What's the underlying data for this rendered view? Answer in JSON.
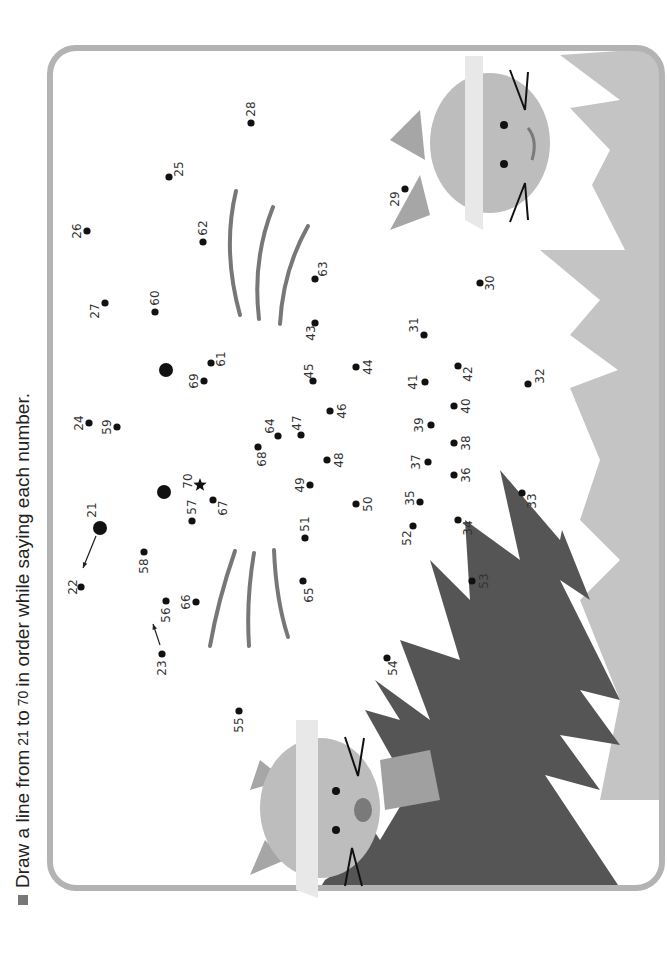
{
  "instruction": {
    "prefix": "Draw a line from",
    "start": "21",
    "middle": "to",
    "end": "70",
    "suffix": "in order while saying each number."
  },
  "colors": {
    "frame": "#b3b3b3",
    "dark_grass": "#555555",
    "light_grass": "#c4c4c4",
    "cat_face": "#bdbdbd",
    "cat_ear": "#a6a6a6",
    "cat_mask": "#e8e8e8",
    "cat_nose": "#7a7a7a",
    "whisker_guides": "#777777",
    "dots": "#111111"
  },
  "puzzle": {
    "start_number": 21,
    "end_number": 70,
    "end_marker": "star-icon",
    "dots": [
      {
        "n": "21",
        "x": 100,
        "y": 528,
        "lx": -8,
        "ly": -18,
        "big": true
      },
      {
        "n": "22",
        "x": 81,
        "y": 587,
        "lx": -8,
        "ly": 0
      },
      {
        "n": "23",
        "x": 162,
        "y": 654,
        "lx": 0,
        "ly": 14
      },
      {
        "n": "24",
        "x": 89,
        "y": 423,
        "lx": -10,
        "ly": 0
      },
      {
        "n": "25",
        "x": 169,
        "y": 177,
        "lx": 10,
        "ly": -8
      },
      {
        "n": "26",
        "x": 87,
        "y": 231,
        "lx": -10,
        "ly": 0
      },
      {
        "n": "27",
        "x": 105,
        "y": 303,
        "lx": -10,
        "ly": 8
      },
      {
        "n": "28",
        "x": 251,
        "y": 123,
        "lx": 0,
        "ly": -14
      },
      {
        "n": "29",
        "x": 405,
        "y": 189,
        "lx": -10,
        "ly": 10
      },
      {
        "n": "30",
        "x": 480,
        "y": 283,
        "lx": 10,
        "ly": 0
      },
      {
        "n": "31",
        "x": 424,
        "y": 335,
        "lx": -10,
        "ly": -10
      },
      {
        "n": "32",
        "x": 528,
        "y": 384,
        "lx": 12,
        "ly": -8
      },
      {
        "n": "33",
        "x": 522,
        "y": 493,
        "lx": 10,
        "ly": 8
      },
      {
        "n": "34",
        "x": 458,
        "y": 520,
        "lx": 10,
        "ly": 8
      },
      {
        "n": "35",
        "x": 420,
        "y": 502,
        "lx": -10,
        "ly": -4
      },
      {
        "n": "36",
        "x": 454,
        "y": 475,
        "lx": 12,
        "ly": 0
      },
      {
        "n": "37",
        "x": 428,
        "y": 462,
        "lx": -12,
        "ly": 0
      },
      {
        "n": "38",
        "x": 454,
        "y": 443,
        "lx": 12,
        "ly": 0
      },
      {
        "n": "39",
        "x": 431,
        "y": 425,
        "lx": -12,
        "ly": 0
      },
      {
        "n": "40",
        "x": 454,
        "y": 406,
        "lx": 12,
        "ly": 0
      },
      {
        "n": "41",
        "x": 425,
        "y": 382,
        "lx": -12,
        "ly": 0
      },
      {
        "n": "42",
        "x": 458,
        "y": 366,
        "lx": 10,
        "ly": 8
      },
      {
        "n": "43",
        "x": 315,
        "y": 323,
        "lx": -4,
        "ly": 10
      },
      {
        "n": "44",
        "x": 356,
        "y": 367,
        "lx": 12,
        "ly": 0
      },
      {
        "n": "45",
        "x": 313,
        "y": 381,
        "lx": -4,
        "ly": -10
      },
      {
        "n": "46",
        "x": 330,
        "y": 411,
        "lx": 12,
        "ly": 0
      },
      {
        "n": "47",
        "x": 301,
        "y": 435,
        "lx": -4,
        "ly": -12
      },
      {
        "n": "48",
        "x": 327,
        "y": 460,
        "lx": 12,
        "ly": 0
      },
      {
        "n": "49",
        "x": 310,
        "y": 485,
        "lx": -10,
        "ly": 0
      },
      {
        "n": "50",
        "x": 356,
        "y": 504,
        "lx": 12,
        "ly": 0
      },
      {
        "n": "51",
        "x": 305,
        "y": 538,
        "lx": 0,
        "ly": -14
      },
      {
        "n": "52",
        "x": 413,
        "y": 526,
        "lx": -6,
        "ly": 12
      },
      {
        "n": "53",
        "x": 472,
        "y": 581,
        "lx": 12,
        "ly": 0
      },
      {
        "n": "54",
        "x": 387,
        "y": 658,
        "lx": 6,
        "ly": 10
      },
      {
        "n": "55",
        "x": 239,
        "y": 711,
        "lx": 0,
        "ly": 14
      },
      {
        "n": "56",
        "x": 166,
        "y": 601,
        "lx": 0,
        "ly": 14
      },
      {
        "n": "57",
        "x": 192,
        "y": 521,
        "lx": 0,
        "ly": -14
      },
      {
        "n": "58",
        "x": 144,
        "y": 552,
        "lx": 0,
        "ly": 14
      },
      {
        "n": "59",
        "x": 117,
        "y": 427,
        "lx": -10,
        "ly": 0
      },
      {
        "n": "60",
        "x": 155,
        "y": 312,
        "lx": 0,
        "ly": -14
      },
      {
        "n": "61",
        "x": 211,
        "y": 363,
        "lx": 10,
        "ly": -4
      },
      {
        "n": "62",
        "x": 203,
        "y": 242,
        "lx": 0,
        "ly": -14
      },
      {
        "n": "63",
        "x": 315,
        "y": 279,
        "lx": 8,
        "ly": -10
      },
      {
        "n": "64",
        "x": 278,
        "y": 436,
        "lx": -8,
        "ly": -10
      },
      {
        "n": "65",
        "x": 303,
        "y": 581,
        "lx": 6,
        "ly": 14
      },
      {
        "n": "66",
        "x": 196,
        "y": 602,
        "lx": -10,
        "ly": 0
      },
      {
        "n": "67",
        "x": 213,
        "y": 500,
        "lx": 10,
        "ly": 8
      },
      {
        "n": "68",
        "x": 258,
        "y": 447,
        "lx": 4,
        "ly": 12
      },
      {
        "n": "69",
        "x": 204,
        "y": 381,
        "lx": -10,
        "ly": 0
      },
      {
        "n": "70",
        "x": 200,
        "y": 485,
        "lx": -12,
        "ly": -4,
        "star": true
      }
    ],
    "eyes": [
      {
        "x": 166,
        "y": 370,
        "r": 7
      },
      {
        "x": 164,
        "y": 492,
        "r": 7
      }
    ],
    "hint_arrows": [
      {
        "from": [
          96,
          536
        ],
        "to": [
          83,
          568
        ]
      },
      {
        "from": [
          160,
          645
        ],
        "to": [
          153,
          624
        ]
      }
    ]
  }
}
